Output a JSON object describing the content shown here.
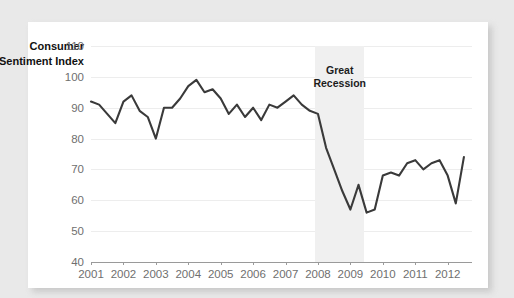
{
  "chart_data": {
    "type": "line",
    "title": "",
    "ylabel": "Consumer Sentiment Index",
    "xlabel": "",
    "ylim": [
      40,
      110
    ],
    "ytick_values": [
      40,
      50,
      60,
      70,
      80,
      90,
      100,
      110
    ],
    "ytick_labels": [
      "40",
      "50",
      "60",
      "70",
      "80",
      "90",
      "100",
      "110"
    ],
    "xlim": [
      2001,
      2012.75
    ],
    "xtick_values": [
      2001,
      2002,
      2003,
      2004,
      2005,
      2006,
      2007,
      2008,
      2009,
      2010,
      2011,
      2012
    ],
    "xtick_labels": [
      "2001",
      "2002",
      "2003",
      "2004",
      "2005",
      "2006",
      "2007",
      "2008",
      "2009",
      "2010",
      "2011",
      "2012"
    ],
    "grid": true,
    "legend": "none",
    "line_color": "#3a3a3a",
    "line_width": 2.1,
    "annotations": [
      {
        "name": "great-recession",
        "text": "Great\nRecession",
        "type": "shaded-band",
        "band_start": 2007.92,
        "band_end": 2009.42,
        "band_color": "#f0f0f0",
        "label_x": 2008.67,
        "label_y": 101.5
      }
    ],
    "x": [
      2001.0,
      2001.25,
      2001.5,
      2001.75,
      2002.0,
      2002.25,
      2002.5,
      2002.75,
      2003.0,
      2003.25,
      2003.5,
      2003.75,
      2004.0,
      2004.25,
      2004.5,
      2004.75,
      2005.0,
      2005.25,
      2005.5,
      2005.75,
      2006.0,
      2006.25,
      2006.5,
      2006.75,
      2007.0,
      2007.25,
      2007.5,
      2007.75,
      2008.0,
      2008.25,
      2008.5,
      2008.75,
      2009.0,
      2009.25,
      2009.5,
      2009.75,
      2010.0,
      2010.25,
      2010.5,
      2010.75,
      2011.0,
      2011.25,
      2011.5,
      2011.75,
      2012.0,
      2012.25,
      2012.5
    ],
    "values": [
      92,
      91,
      88,
      85,
      92,
      94,
      89,
      87,
      80,
      90,
      90,
      93,
      97,
      99,
      95,
      96,
      93,
      88,
      91,
      87,
      90,
      86,
      91,
      90,
      92,
      94,
      91,
      89,
      88,
      77,
      70,
      63,
      57,
      65,
      56,
      57,
      68,
      69,
      68,
      72,
      73,
      70,
      72,
      73,
      68,
      59,
      74
    ],
    "series_name": "Consumer Sentiment Index"
  }
}
